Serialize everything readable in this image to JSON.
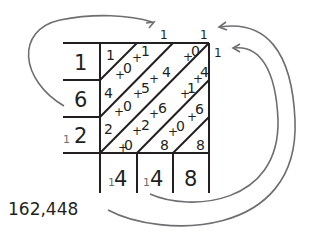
{
  "diagram": {
    "type": "lattice-addition",
    "colors": {
      "ink": "#231f20",
      "arrow": "#6d6e70",
      "background": "#ffffff"
    },
    "row_labels": [
      "1",
      "6",
      "12"
    ],
    "row_label_carries": [
      "",
      "",
      "1"
    ],
    "row_label_digits": [
      "1",
      "6",
      "2"
    ],
    "top_carries": [
      "1",
      "1"
    ],
    "right_carry": "1",
    "cells": {
      "r0": [
        "1",
        "0",
        "1",
        "4",
        "0"
      ],
      "r1": [
        "4",
        "0",
        "5",
        "4",
        "1",
        "4"
      ],
      "r2": [
        "2",
        "0",
        "2",
        "6",
        "0",
        "6"
      ],
      "r3": [
        "0",
        "8",
        "8"
      ]
    },
    "cell_plus_sign": "+",
    "result_digits": [
      {
        "carry": "1",
        "digit": "4"
      },
      {
        "carry": "1",
        "digit": "4"
      },
      {
        "carry": "",
        "digit": "8"
      }
    ],
    "answer": "162,448"
  }
}
